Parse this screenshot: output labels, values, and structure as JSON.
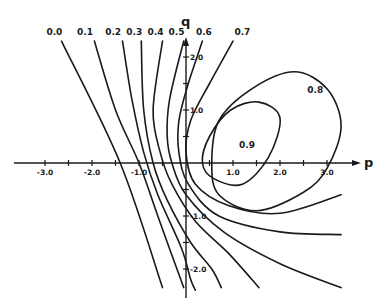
{
  "chart_data": {
    "type": "line",
    "title": "",
    "xlabel": "p",
    "ylabel": "q",
    "xlim": [
      -3.8,
      3.7
    ],
    "ylim": [
      -2.7,
      2.5
    ],
    "grid": false,
    "x_ticks": [
      -3.0,
      -2.5,
      -2.0,
      -1.5,
      -1.0,
      -0.5,
      0.5,
      1.0,
      1.5,
      2.0,
      2.5,
      3.0
    ],
    "x_tick_labels": [
      {
        "value": -3.0,
        "label": "-3.0"
      },
      {
        "value": -2.0,
        "label": "-2.0"
      },
      {
        "value": -1.0,
        "label": "-1.0"
      },
      {
        "value": 1.0,
        "label": "1.0"
      },
      {
        "value": 2.0,
        "label": "2.0"
      },
      {
        "value": 3.0,
        "label": "3.0"
      }
    ],
    "y_ticks": [
      -2.0,
      -1.5,
      -1.0,
      -0.5,
      0.5,
      1.0,
      1.5,
      2.0
    ],
    "y_tick_labels": [
      {
        "value": 2.0,
        "label": "2.0"
      },
      {
        "value": 1.0,
        "label": "1.0"
      },
      {
        "value": -1.0,
        "label": "-1.0"
      },
      {
        "value": -2.0,
        "label": "-2.0"
      }
    ],
    "series": [
      {
        "name": "0.0",
        "label": "0.0",
        "closed": false,
        "points": [
          [
            -2.65,
            2.3
          ],
          [
            -1.4,
            0.0
          ],
          [
            -0.5,
            -2.35
          ]
        ]
      },
      {
        "name": "0.1",
        "label": "0.1",
        "closed": false,
        "points": [
          [
            -1.95,
            2.3
          ],
          [
            -1.5,
            1.0
          ],
          [
            -1.0,
            0.0
          ],
          [
            -0.6,
            -1.0
          ],
          [
            -0.05,
            -2.35
          ]
        ]
      },
      {
        "name": "0.2",
        "label": "0.2",
        "closed": false,
        "points": [
          [
            -1.35,
            2.3
          ],
          [
            -1.15,
            1.2
          ],
          [
            -0.9,
            0.2
          ],
          [
            -0.6,
            -0.6
          ],
          [
            -0.1,
            -1.6
          ],
          [
            0.1,
            -2.2
          ],
          [
            0.2,
            -2.4
          ]
        ]
      },
      {
        "name": "0.3",
        "label": "0.3",
        "closed": false,
        "points": [
          [
            -0.95,
            2.3
          ],
          [
            -0.9,
            1.0
          ],
          [
            -0.7,
            0.0
          ],
          [
            -0.4,
            -0.7
          ],
          [
            0.1,
            -1.5
          ],
          [
            0.55,
            -2.0
          ],
          [
            0.75,
            -2.35
          ]
        ]
      },
      {
        "name": "0.4",
        "label": "0.4",
        "closed": false,
        "points": [
          [
            -0.5,
            2.3
          ],
          [
            -0.7,
            1.0
          ],
          [
            -0.55,
            0.2
          ],
          [
            -0.3,
            -0.4
          ],
          [
            0.2,
            -1.1
          ],
          [
            0.9,
            -1.7
          ],
          [
            1.55,
            -2.35
          ]
        ]
      },
      {
        "name": "0.5",
        "label": "0.5",
        "closed": false,
        "points": [
          [
            -0.05,
            2.3
          ],
          [
            -0.35,
            1.2
          ],
          [
            -0.4,
            0.5
          ],
          [
            -0.3,
            0.0
          ],
          [
            0.0,
            -0.6
          ],
          [
            0.8,
            -1.3
          ],
          [
            2.0,
            -1.9
          ],
          [
            3.3,
            -2.35
          ]
        ]
      },
      {
        "name": "0.6",
        "label": "0.6",
        "closed": false,
        "points": [
          [
            0.35,
            2.3
          ],
          [
            0.05,
            1.5
          ],
          [
            -0.15,
            0.8
          ],
          [
            -0.15,
            0.2
          ],
          [
            0.05,
            -0.4
          ],
          [
            0.7,
            -1.0
          ],
          [
            2.0,
            -1.3
          ],
          [
            3.3,
            -1.35
          ]
        ]
      },
      {
        "name": "0.7",
        "label": "0.7",
        "closed": false,
        "points": [
          [
            1.0,
            2.3
          ],
          [
            0.5,
            1.5
          ],
          [
            0.1,
            0.8
          ],
          [
            0.0,
            0.2
          ],
          [
            0.2,
            -0.4
          ],
          [
            0.9,
            -0.8
          ],
          [
            2.0,
            -0.95
          ],
          [
            3.3,
            -0.6
          ]
        ]
      },
      {
        "name": "0.8",
        "label": "0.8",
        "closed": true,
        "points": [
          [
            0.55,
            0.0
          ],
          [
            0.7,
            0.8
          ],
          [
            1.4,
            1.4
          ],
          [
            2.3,
            1.72
          ],
          [
            3.0,
            1.4
          ],
          [
            3.3,
            0.7
          ],
          [
            3.0,
            -0.1
          ],
          [
            2.5,
            -0.55
          ],
          [
            1.5,
            -0.9
          ],
          [
            0.7,
            -0.6
          ]
        ]
      },
      {
        "name": "0.9",
        "label": "0.9",
        "closed": true,
        "points": [
          [
            0.35,
            0.0
          ],
          [
            0.5,
            0.5
          ],
          [
            0.95,
            1.0
          ],
          [
            1.55,
            1.15
          ],
          [
            2.0,
            0.85
          ],
          [
            1.75,
            0.1
          ],
          [
            1.2,
            -0.4
          ],
          [
            0.6,
            -0.3
          ]
        ]
      }
    ],
    "annotations": [
      {
        "text": "0.0",
        "p": -2.8,
        "q": 2.5
      },
      {
        "text": "0.1",
        "p": -2.15,
        "q": 2.5
      },
      {
        "text": "0.2",
        "p": -1.55,
        "q": 2.5
      },
      {
        "text": "0.3",
        "p": -1.1,
        "q": 2.5
      },
      {
        "text": "0.4",
        "p": -0.65,
        "q": 2.5
      },
      {
        "text": "0.5",
        "p": -0.2,
        "q": 2.5
      },
      {
        "text": "0.6",
        "p": 0.38,
        "q": 2.5
      },
      {
        "text": "0.7",
        "p": 1.2,
        "q": 2.5
      },
      {
        "text": "0.8",
        "p": 2.75,
        "q": 1.4
      },
      {
        "text": "0.9",
        "p": 1.3,
        "q": 0.35
      }
    ]
  }
}
